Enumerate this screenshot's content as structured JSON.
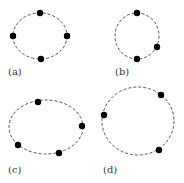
{
  "style": {
    "stroke_color": "#555555",
    "point_color": "#000000",
    "background": "#ffffff"
  },
  "panels": [
    {
      "label": "(a)",
      "shape": "ellipse",
      "cx": 40,
      "cy": 36,
      "rx": 27,
      "ry": 23,
      "points": [
        [
          40,
          13
        ],
        [
          13,
          36
        ],
        [
          67,
          36
        ],
        [
          41,
          59
        ]
      ],
      "label_pos": [
        8,
        75
      ]
    },
    {
      "label": "(b)",
      "shape": "circle",
      "cx": 137,
      "cy": 36,
      "rx": 22,
      "ry": 23,
      "points": [
        [
          137,
          13
        ],
        [
          157,
          47
        ],
        [
          137,
          59
        ]
      ],
      "label_pos": [
        115,
        75
      ]
    },
    {
      "label": "(c)",
      "shape": "ellipse",
      "cx": 46,
      "cy": 127,
      "rx": 37,
      "ry": 27,
      "points": [
        [
          38,
          102
        ],
        [
          82,
          126
        ],
        [
          18,
          145
        ],
        [
          59,
          153
        ]
      ],
      "label_pos": [
        8,
        173
      ]
    },
    {
      "label": "(d)",
      "shape": "circle",
      "cx": 138,
      "cy": 121,
      "rx": 36,
      "ry": 34,
      "points": [
        [
          161,
          95
        ],
        [
          104,
          115
        ],
        [
          159,
          150
        ]
      ],
      "label_pos": [
        103,
        173
      ]
    }
  ]
}
